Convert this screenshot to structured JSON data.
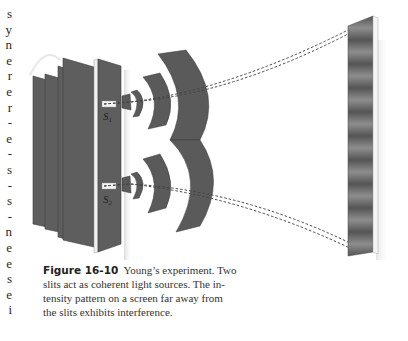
{
  "left_margin": {
    "clipped_chars": [
      "s",
      "y",
      "n",
      "e",
      "r",
      "e",
      "r",
      "-",
      "e",
      "-",
      "s",
      "-",
      "s",
      "-",
      "n",
      "e",
      "e",
      "s",
      "e",
      "i"
    ]
  },
  "figure": {
    "slit_labels": [
      "S1",
      "S2"
    ],
    "slit_label_main": "S",
    "slit_label_subs": [
      "1",
      "2"
    ],
    "colors": {
      "plate": "#5e5e5e",
      "plate_edge": "#3f3f3f",
      "wavefront": "#5a5a5a",
      "screen_dark": "#4a4a4a",
      "screen_light": "#8a8a8a",
      "dash": "#444444"
    },
    "fringe_count": 10
  },
  "caption": {
    "label": "Figure 16-10",
    "lines": [
      "Young’s experiment. Two",
      "slits act as coherent light sources. The in-",
      "tensity pattern on a screen far away from",
      "the slits exhibits interference."
    ]
  }
}
